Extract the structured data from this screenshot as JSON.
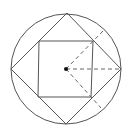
{
  "diagram": {
    "colors": {
      "stroke": "#555555",
      "dash": "#666666",
      "center": "#111111",
      "background": "#ffffff"
    },
    "circle": {
      "cx": 66,
      "cy": 69,
      "r": 55
    },
    "outer_diamond": {
      "points": "67,13 121,69 66,124 11,69"
    },
    "inner_square": {
      "points": "39,41 93,41 91,97 38,97"
    },
    "center_point": {
      "x": 66,
      "y": 69,
      "r": 2
    },
    "dashed_lines": [
      {
        "x1": 66,
        "y1": 69,
        "x2": 103,
        "y2": 31
      },
      {
        "x1": 66,
        "y1": 69,
        "x2": 121,
        "y2": 69
      },
      {
        "x1": 66,
        "y1": 69,
        "x2": 101,
        "y2": 108
      }
    ]
  }
}
